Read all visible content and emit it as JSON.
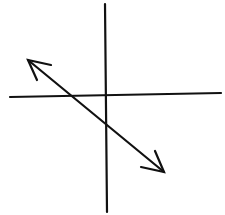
{
  "diagram": {
    "type": "coordinate-plane-line",
    "colors": {
      "background": "#ffffff",
      "stroke": "#111111"
    },
    "axes": {
      "x_axis": {
        "x1": 10,
        "y1": 97,
        "x2": 221,
        "y2": 93
      },
      "y_axis": {
        "x1": 105,
        "y1": 4,
        "x2": 107,
        "y2": 212
      },
      "labels": []
    },
    "line": {
      "x1": 28,
      "y1": 60,
      "x2": 164,
      "y2": 172,
      "slope": "negative",
      "x_intercept": "negative",
      "y_intercept": "negative",
      "arrows": "both-ends"
    }
  }
}
